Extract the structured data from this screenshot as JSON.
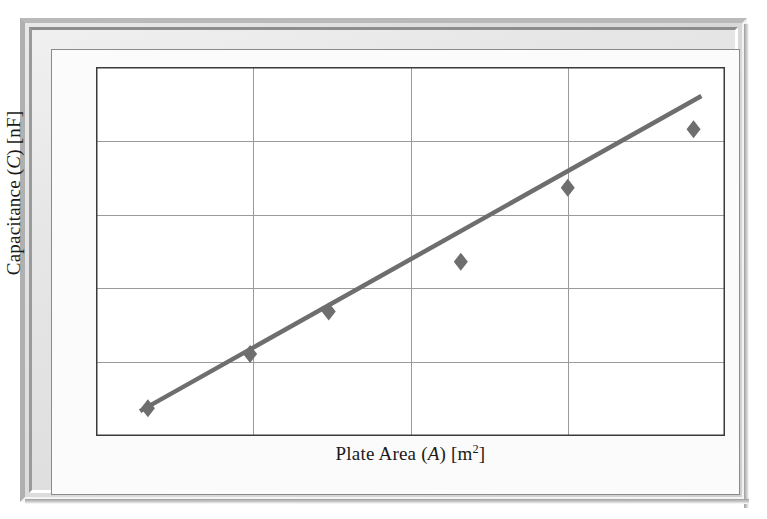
{
  "figure": {
    "kind": "scientific-figure",
    "frame_style": "beveled-gray-picture-frame"
  },
  "axes": {
    "y_title_text": "Capacitance (C) [nF]",
    "y_title_prefix": "Capacitance (",
    "y_title_symbol": "C",
    "y_title_suffix": ") [nF]",
    "x_title_text": "Plate Area (A) [m2]",
    "x_title_prefix": "Plate Area (",
    "x_title_symbol": "A",
    "x_title_mid": ") [m",
    "x_title_exponent": "2",
    "x_title_suffix": "]"
  },
  "annotation": {
    "equation_text": "C = 19.15 A",
    "equation_lhs": "C",
    "equation_operator": "=",
    "equation_slope": "19.15",
    "equation_variable": "A"
  },
  "colors": {
    "marker": "#6e6e6e",
    "trend_line": "#6e6e6e",
    "gridline": "#9a9a9a",
    "axis_border": "#3a3a3a",
    "plot_background": "#ffffff",
    "frame_gray": "#d8d8d8",
    "text": "#1a1a1a"
  },
  "chart_data": {
    "type": "scatter",
    "title": "",
    "subtitle": "",
    "xlabel": "Plate Area (A) [m2]",
    "ylabel": "Capacitance (C) [nF]",
    "xlim": [
      0,
      4
    ],
    "ylim": [
      0,
      80
    ],
    "grid": true,
    "grid_x_values": [
      1,
      2,
      3
    ],
    "grid_y_values": [
      16,
      32,
      48,
      64
    ],
    "tick_labels_shown": false,
    "xticks": [],
    "yticks": [],
    "legend": null,
    "legend_position": "none",
    "marker_shape": "diamond",
    "series": [
      {
        "name": "Measured capacitance",
        "type": "scatter",
        "x": [
          0.33,
          0.98,
          1.48,
          2.32,
          3.0,
          3.8
        ],
        "y": [
          6.0,
          17.8,
          27.0,
          37.8,
          53.8,
          66.5
        ]
      },
      {
        "name": "Best-fit line",
        "type": "line",
        "equation": "C = 19.15 A",
        "slope": 19.15,
        "intercept": 0,
        "x": [
          0.28,
          3.85
        ],
        "y": [
          5.4,
          73.7
        ]
      }
    ],
    "annotations": [
      {
        "text": "C = 19.15 A",
        "x": 2.68,
        "y": 31.5
      }
    ]
  }
}
